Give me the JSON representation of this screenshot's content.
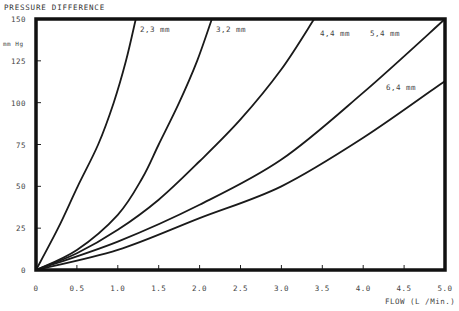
{
  "chart_data": {
    "type": "line",
    "title": "",
    "ylabel": "PRESSURE DIFFERENCE",
    "yunit": "mm Hg",
    "xlabel": "FLOW (L /Min.)",
    "xlim": [
      0,
      5.0
    ],
    "ylim": [
      0,
      150
    ],
    "grid": false,
    "x_ticks": [
      0,
      0.5,
      1.0,
      1.5,
      2.0,
      2.5,
      3.0,
      3.5,
      4.0,
      4.5,
      5.0
    ],
    "x_tick_labels": [
      "0",
      "0.5",
      "1.0",
      "1.5",
      "2.0",
      "2.5",
      "3.0",
      "3.5",
      "4.0",
      "4.5",
      "5.0"
    ],
    "y_ticks": [
      0,
      25,
      50,
      75,
      100,
      125,
      150
    ],
    "y_tick_labels": [
      "0",
      "25",
      "50",
      "75",
      "100",
      "125",
      "150"
    ],
    "series": [
      {
        "name": "2.3 mm",
        "label": "2,3 mm",
        "points": [
          [
            0,
            0
          ],
          [
            0.27,
            25
          ],
          [
            0.51,
            50
          ],
          [
            0.76,
            75
          ],
          [
            0.95,
            100
          ],
          [
            1.1,
            125
          ],
          [
            1.22,
            150
          ]
        ]
      },
      {
        "name": "3.2 mm",
        "label": "3,2 mm",
        "points": [
          [
            0,
            0
          ],
          [
            0.5,
            12
          ],
          [
            1.0,
            33
          ],
          [
            1.3,
            55
          ],
          [
            1.5,
            75
          ],
          [
            1.75,
            100
          ],
          [
            1.97,
            125
          ],
          [
            2.15,
            150
          ]
        ]
      },
      {
        "name": "4.4 mm",
        "label": "4,4  mm",
        "points": [
          [
            0,
            0
          ],
          [
            0.5,
            10
          ],
          [
            1.0,
            24
          ],
          [
            1.5,
            42
          ],
          [
            2.0,
            65
          ],
          [
            2.5,
            90
          ],
          [
            3.0,
            120
          ],
          [
            3.4,
            150
          ]
        ]
      },
      {
        "name": "5.4 mm",
        "label": "5,4 mm",
        "points": [
          [
            0,
            0
          ],
          [
            1.0,
            17
          ],
          [
            2.0,
            39
          ],
          [
            3.0,
            66
          ],
          [
            4.0,
            106
          ],
          [
            5.0,
            150
          ]
        ]
      },
      {
        "name": "6.4 mm",
        "label": "6,4 mm",
        "points": [
          [
            0,
            0
          ],
          [
            1.0,
            12
          ],
          [
            2.0,
            31
          ],
          [
            3.0,
            50
          ],
          [
            4.0,
            79
          ],
          [
            5.0,
            113
          ]
        ]
      }
    ]
  }
}
